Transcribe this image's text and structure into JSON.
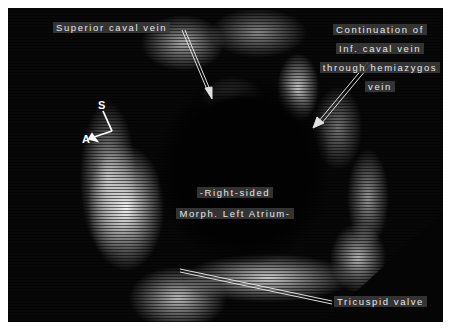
{
  "image": {
    "type": "echocardiogram",
    "background_color": "#ffffff",
    "frame_color": "#080808"
  },
  "labels": {
    "superior_caval_vein": "Superior caval  vein",
    "continuation": [
      "Continuation of",
      "Inf. caval vein",
      "through hemiazygos",
      "vein"
    ],
    "atrium": [
      "-Right-sided",
      "Morph. Left Atrium-"
    ],
    "tricuspid_valve": "Tricuspid valve"
  },
  "orientation": {
    "superior": "S",
    "anterior": "A"
  }
}
